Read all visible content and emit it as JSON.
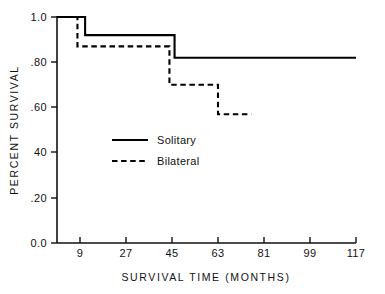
{
  "chart_data": {
    "type": "line",
    "title": "",
    "subtitle": "",
    "xlabel": "SURVIVAL TIME (MONTHS)",
    "ylabel": "PERCENT SURVIVAL",
    "xlim": [
      0,
      117
    ],
    "ylim": [
      0.0,
      1.0
    ],
    "grid": false,
    "legend_position": "center-left-inside",
    "x_ticks": [
      9,
      27,
      45,
      63,
      81,
      99,
      117
    ],
    "x_tick_labels": [
      "9",
      "27",
      "45",
      "63",
      "81",
      "99",
      "117"
    ],
    "y_ticks": [
      0.0,
      0.2,
      0.4,
      0.6,
      0.8,
      1.0
    ],
    "y_tick_labels": [
      "0.0",
      ".20",
      "40",
      ".60",
      ".80",
      "1.0"
    ],
    "step_style": "post",
    "series": [
      {
        "name": "Solitary",
        "style": "solid",
        "color": "#000000",
        "x": [
          0,
          11,
          11,
          46,
          46,
          117
        ],
        "y": [
          1.0,
          1.0,
          0.92,
          0.92,
          0.82,
          0.82
        ],
        "steps": [
          {
            "from_month": 0,
            "to_month": 11,
            "survival": 1.0
          },
          {
            "from_month": 11,
            "to_month": 46,
            "survival": 0.92
          },
          {
            "from_month": 46,
            "to_month": 117,
            "survival": 0.82
          }
        ]
      },
      {
        "name": "Bilateral",
        "style": "dashed",
        "color": "#000000",
        "x": [
          0,
          8,
          8,
          44,
          44,
          63,
          63,
          76
        ],
        "y": [
          1.0,
          1.0,
          0.87,
          0.87,
          0.7,
          0.7,
          0.57,
          0.57
        ],
        "steps": [
          {
            "from_month": 0,
            "to_month": 8,
            "survival": 1.0
          },
          {
            "from_month": 8,
            "to_month": 44,
            "survival": 0.87
          },
          {
            "from_month": 44,
            "to_month": 63,
            "survival": 0.7
          },
          {
            "from_month": 63,
            "to_month": 76,
            "survival": 0.57
          }
        ]
      }
    ],
    "legend_entries": [
      {
        "label": "Solitary",
        "style": "solid"
      },
      {
        "label": "Bilateral",
        "style": "dashed"
      }
    ]
  },
  "axes": {
    "y_title": "PERCENT SURVIVAL",
    "x_title": "SURVIVAL TIME (MONTHS)",
    "y_labels": {
      "t100": "1.0",
      "t80": ".80",
      "t60": ".60",
      "t40": "40",
      "t20": ".20",
      "t00": "0.0"
    },
    "x_labels": {
      "t9": "9",
      "t27": "27",
      "t45": "45",
      "t63": "63",
      "t81": "81",
      "t99": "99",
      "t117": "117"
    }
  },
  "legend": {
    "solitary": "Solitary",
    "bilateral": "Bilateral"
  }
}
